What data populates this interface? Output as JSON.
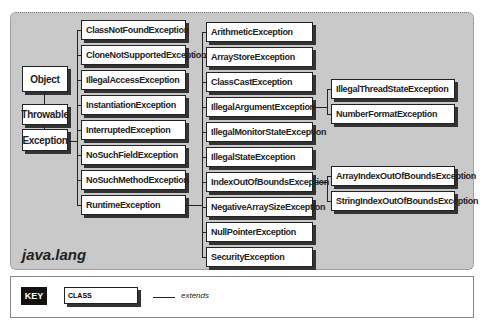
{
  "package": "java.lang",
  "roots": [
    "Object",
    "Throwable",
    "Exception"
  ],
  "column1": [
    "ClassNotFoundException",
    "CloneNotSupportedException",
    "IllegalAccessException",
    "InstantiationException",
    "InterruptedException",
    "NoSuchFieldException",
    "NoSuchMethodException",
    "RuntimeException"
  ],
  "column2": [
    "ArithmeticException",
    "ArrayStoreException",
    "ClassCastException",
    "IllegalArgumentException",
    "IllegalMonitorStateException",
    "IllegalStateException",
    "IndexOutOfBoundsException",
    "NegativeArraySizeException",
    "NullPointerException",
    "SecurityException"
  ],
  "column3": [
    "IllegalThreadStateException",
    "NumberFormatException",
    "ArrayIndexOutOfBoundsException",
    "StringIndexOutOfBoundsException"
  ],
  "key": {
    "label": "KEY",
    "class_label": "CLASS",
    "extends_label": "extends"
  }
}
